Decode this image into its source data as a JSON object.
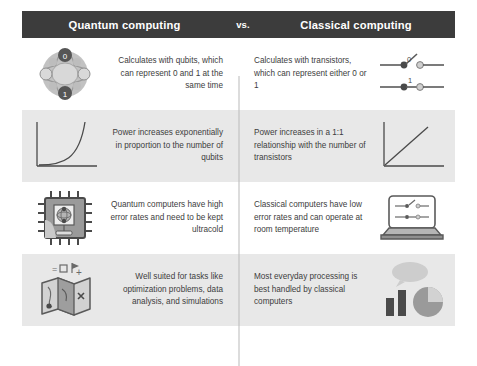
{
  "header": {
    "left_title": "Quantum computing",
    "middle_label": "vs.",
    "right_title": "Classical computing",
    "bar_color": "#3c3c3c",
    "text_color": "#ffffff"
  },
  "theme": {
    "page_background": "#ffffff",
    "shaded_row_background": "#e8e8e8",
    "plain_row_background": "#ffffff",
    "body_text_color": "#3d3d3d",
    "divider_color": "#b9b9b9",
    "icon_dark": "#4a4a4a",
    "icon_mid": "#8d8d8d",
    "icon_light": "#c9c9c9"
  },
  "rows": [
    {
      "shaded": false,
      "left": {
        "icon": "qubit-bloch-sphere-icon",
        "icon_labels": {
          "top": "0",
          "bottom": "1"
        },
        "text": "Calculates with qubits, which can represent 0 and 1 at the same time"
      },
      "right": {
        "icon": "transistor-switches-icon",
        "icon_labels": {
          "open_switch": "0",
          "closed_switch": "1"
        },
        "text": "Calculates with transistors, which can represent either 0 or 1"
      }
    },
    {
      "shaded": true,
      "left": {
        "icon": "exponential-growth-graph-icon",
        "text": "Power increases exponentially in proportion to the number of qubits"
      },
      "right": {
        "icon": "linear-growth-graph-icon",
        "text": "Power increases in a 1:1 relationship with the number of transistors"
      }
    },
    {
      "shaded": false,
      "left": {
        "icon": "quantum-chip-icon",
        "text": "Quantum computers have high error rates and need to be kept ultracold"
      },
      "right": {
        "icon": "laptop-icon",
        "text": "Classical computers have low error rates and can operate at room temperature"
      }
    },
    {
      "shaded": true,
      "left": {
        "icon": "folded-treasure-map-icon",
        "text": "Well suited for tasks like optimization problems, data analysis, and simulations"
      },
      "right": {
        "icon": "bar-and-pie-chart-icon",
        "text": "Most everyday processing is best handled by classical computers"
      }
    }
  ]
}
